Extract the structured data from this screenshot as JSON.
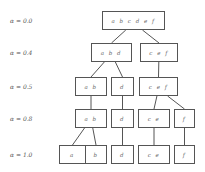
{
  "diagram": {
    "type": "hierarchical-clustering-tree",
    "levels": [
      {
        "label": "α = 0.0",
        "y": 11,
        "nodes": [
          {
            "id": "n0",
            "text": "a b c d e f",
            "x": 102,
            "w": 63
          }
        ]
      },
      {
        "label": "α = 0.4",
        "y": 43,
        "nodes": [
          {
            "id": "n1",
            "text": "a b d",
            "x": 91,
            "w": 41
          },
          {
            "id": "n2",
            "text": "c e f",
            "x": 140,
            "w": 38
          }
        ]
      },
      {
        "label": "α = 0.5",
        "y": 77,
        "nodes": [
          {
            "id": "n3",
            "text": "a b",
            "x": 75,
            "w": 32
          },
          {
            "id": "n4",
            "text": "d",
            "x": 111,
            "w": 23
          },
          {
            "id": "n5",
            "text": "c e f",
            "x": 139,
            "w": 39
          }
        ]
      },
      {
        "label": "α = 0.8",
        "y": 109,
        "nodes": [
          {
            "id": "n6",
            "text": "a b",
            "x": 75,
            "w": 32
          },
          {
            "id": "n7",
            "text": "d",
            "x": 111,
            "w": 23
          },
          {
            "id": "n8",
            "text": "c e",
            "x": 138,
            "w": 32
          },
          {
            "id": "n9",
            "text": "f",
            "x": 174,
            "w": 21
          }
        ]
      },
      {
        "label": "α = 1.0",
        "y": 145,
        "nodes": [
          {
            "id": "n10",
            "text": "a",
            "x": 59,
            "w": 27
          },
          {
            "id": "n11",
            "text": "b",
            "x": 85,
            "w": 22
          },
          {
            "id": "n12",
            "text": "d",
            "x": 111,
            "w": 23
          },
          {
            "id": "n13",
            "text": "c e",
            "x": 138,
            "w": 32
          },
          {
            "id": "n14",
            "text": "f",
            "x": 174,
            "w": 21
          }
        ]
      }
    ],
    "edges": [
      [
        "n0",
        "n1"
      ],
      [
        "n0",
        "n2"
      ],
      [
        "n1",
        "n3"
      ],
      [
        "n1",
        "n4"
      ],
      [
        "n2",
        "n5"
      ],
      [
        "n3",
        "n6"
      ],
      [
        "n4",
        "n7"
      ],
      [
        "n5",
        "n8"
      ],
      [
        "n5",
        "n9"
      ],
      [
        "n6",
        "n10"
      ],
      [
        "n6",
        "n11"
      ],
      [
        "n7",
        "n12"
      ],
      [
        "n8",
        "n13"
      ],
      [
        "n9",
        "n14"
      ]
    ]
  }
}
